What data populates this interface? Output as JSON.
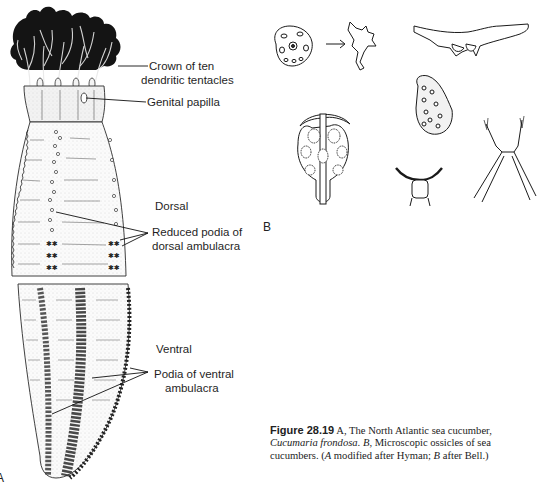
{
  "figure": {
    "number": "Figure 28.19",
    "panels": [
      "A",
      "B"
    ],
    "caption": {
      "label": "Figure 28.19",
      "part1": " A, The North Atlantic sea cucumber, ",
      "species": "Cucumaria frondosa",
      "part2": ". ",
      "b_letter": "B",
      "part3": ", Microscopic ossicles of sea cucumbers. (",
      "a_letter": "A",
      "part4": " modified after Hyman; ",
      "b_letter2": "B",
      "part5": " after Bell.)"
    }
  },
  "panel_a": {
    "letter": "A",
    "labels": {
      "crown_line1": "Crown of ten",
      "crown_line2": "dendritic tentacles",
      "genital_papilla": "Genital papilla",
      "dorsal": "Dorsal",
      "reduced_podia_line1": "Reduced podia of",
      "reduced_podia_line2": "dorsal ambulacra",
      "ventral": "Ventral",
      "ventral_podia_line1": "Podia of ventral",
      "ventral_podia_line2": "ambulacra"
    }
  },
  "panel_b": {
    "letter": "B",
    "ossicles": [
      "perforated-plate",
      "arrow",
      "branched-fragment",
      "curved-rod",
      "anchor-plate",
      "perforated-oval-plate",
      "c-shaped-ossicle",
      "x-shaped-spiny-ossicle"
    ]
  },
  "colors": {
    "ink": "#1a1a1a",
    "paper": "#ffffff",
    "stipple": "#9a9a9a"
  }
}
